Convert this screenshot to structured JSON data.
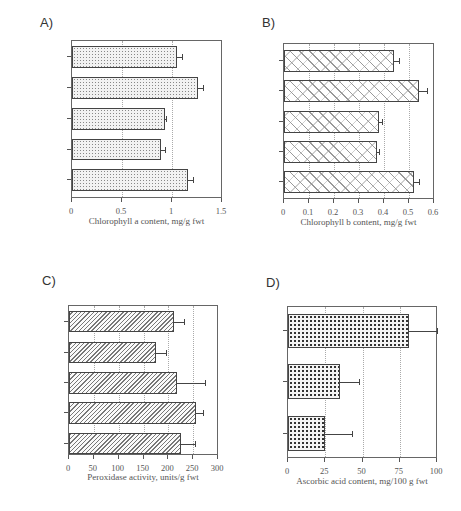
{
  "chart_data": [
    {
      "panel": "A)",
      "type": "bar",
      "orientation": "horizontal",
      "categories": [
        "GH-HWY",
        "GH-side road",
        "Lindfield",
        "Rozelle",
        "Richmond"
      ],
      "values": [
        1.05,
        1.26,
        0.93,
        0.89,
        1.16
      ],
      "errors": [
        0.05,
        0.05,
        0.01,
        0.04,
        0.05
      ],
      "xlabel": "Chlorophyll a content, mg/g fwt",
      "xlim": [
        0,
        1.5
      ],
      "xticks": [
        "0",
        "0.5",
        "1",
        "1.5"
      ],
      "grid": true
    },
    {
      "panel": "B)",
      "type": "bar",
      "orientation": "horizontal",
      "categories": [
        "GH-HWY",
        "GH-side road",
        "Lindfield",
        "Rozelle",
        "Richmond"
      ],
      "values": [
        0.44,
        0.54,
        0.38,
        0.37,
        0.52
      ],
      "errors": [
        0.02,
        0.03,
        0.01,
        0.01,
        0.02
      ],
      "xlabel": "Chlorophyll b content, mg/g fwt",
      "xlim": [
        0,
        0.6
      ],
      "xticks": [
        "0",
        "0.1",
        "0.2",
        "0.3",
        "0.4",
        "0.5",
        "0.6"
      ],
      "grid": true
    },
    {
      "panel": "C)",
      "type": "bar",
      "orientation": "horizontal",
      "categories": [
        "GH-HWY",
        "GH-side road",
        "Lindfield",
        "Rozelle",
        "Richmond"
      ],
      "values": [
        211,
        176,
        217,
        255,
        226
      ],
      "errors": [
        21,
        19,
        56,
        15,
        27
      ],
      "xlabel": "Peroxidase activity, units/g fwt",
      "xlim": [
        0,
        300
      ],
      "xticks": [
        "0",
        "50",
        "100",
        "150",
        "200",
        "250",
        "300"
      ],
      "grid": true
    },
    {
      "panel": "D)",
      "type": "bar",
      "orientation": "horizontal",
      "categories": [
        "Lindfield",
        "Rozelle",
        "Richmond"
      ],
      "values": [
        81.5,
        35,
        25
      ],
      "errors": [
        18.5,
        12.5,
        18
      ],
      "xlabel": "Ascorbic acid content, mg/100 g fwt",
      "xlim": [
        0,
        100
      ],
      "xticks": [
        "0",
        "25",
        "50",
        "75",
        "100"
      ],
      "grid": true
    }
  ]
}
